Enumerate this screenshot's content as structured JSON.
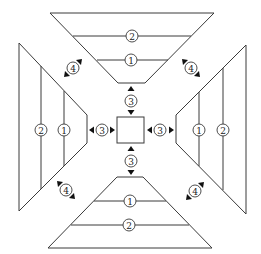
{
  "diagram": {
    "type": "symmetric four-panel trapezoid layout around a central square",
    "colors": {
      "line": "#3a3a3a",
      "arrow": "#111111",
      "background": "#ffffff"
    },
    "center_square": {
      "label": ""
    },
    "panels": {
      "top": {
        "line_labels": [
          "1",
          "2"
        ]
      },
      "bottom": {
        "line_labels": [
          "1",
          "2"
        ]
      },
      "left": {
        "line_labels": [
          "1",
          "2"
        ]
      },
      "right": {
        "line_labels": [
          "1",
          "2"
        ]
      }
    },
    "markers": {
      "gap_top": "3",
      "gap_bottom": "3",
      "gap_left": "3",
      "gap_right": "3",
      "corner_top_left": "4",
      "corner_top_right": "4",
      "corner_bottom_left": "4",
      "corner_bottom_right": "4"
    },
    "legend_note": "Circled numbers: 1 inner line, 2 outer line, 3 gap between center and panel, 4 gap between adjacent panels"
  }
}
